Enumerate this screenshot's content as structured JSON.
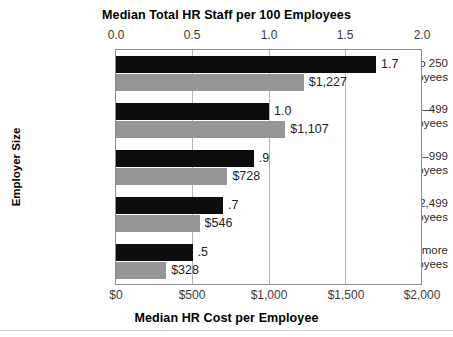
{
  "chart_data": {
    "type": "bar",
    "orientation": "horizontal",
    "title": "Median Total HR Staff per 100 Employees",
    "subtitle": "",
    "xlabel": "Median HR Cost per Employee",
    "ylabel": "Employer Size",
    "top_axis": {
      "label": "Median Total HR Staff per 100 Employees",
      "ticks": [
        "0.0",
        "0.5",
        "1.0",
        "1.5",
        "2.0"
      ],
      "tick_values": [
        0.0,
        0.5,
        1.0,
        1.5,
        2.0
      ],
      "range": [
        0.0,
        2.0
      ]
    },
    "bottom_axis": {
      "label": "Median HR Cost per Employee",
      "ticks": [
        "$0",
        "$500",
        "$1,000",
        "$1,500",
        "$2,000"
      ],
      "tick_values": [
        0,
        500,
        1000,
        1500,
        2000
      ],
      "range": [
        0,
        2000
      ]
    },
    "categories": [
      "Up to 250 employees",
      "250–499 employees",
      "500–999 employees",
      "1,000–2,499 employees",
      "2,500 or more employees"
    ],
    "category_lines": [
      [
        "Up to 250",
        "employees"
      ],
      [
        "250–499",
        "employees"
      ],
      [
        "500–999",
        "employees"
      ],
      [
        "1,000–2,499",
        "employees"
      ],
      [
        "2,500 or more",
        "employees"
      ]
    ],
    "grid": true,
    "legend": "none",
    "series": [
      {
        "name": "Median Total HR Staff per 100 Employees",
        "color": "#0d0d0d",
        "axis": "top",
        "values": [
          1.7,
          1.0,
          0.9,
          0.7,
          0.5
        ],
        "labels": [
          "1.7",
          "1.0",
          ".9",
          ".7",
          ".5"
        ]
      },
      {
        "name": "Median HR Cost per Employee",
        "color": "#969696",
        "axis": "bottom",
        "values": [
          1227,
          1107,
          728,
          546,
          328
        ],
        "labels": [
          "$1,227",
          "$1,107",
          "$728",
          "$546",
          "$328"
        ]
      }
    ]
  },
  "colors": {
    "dark_bar": "#0d0d0d",
    "light_bar": "#969696",
    "gridline": "#b5b5b5",
    "frame": "#8d8d8d",
    "text": "#231f20",
    "background": "#ffffff"
  }
}
